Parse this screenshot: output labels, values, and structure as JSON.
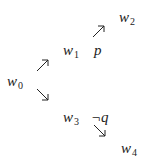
{
  "nodes": {
    "w0": {
      "base": "w",
      "sub": "0"
    },
    "w1": {
      "base": "w",
      "sub": "1"
    },
    "w2": {
      "base": "w",
      "sub": "2"
    },
    "w3": {
      "base": "w",
      "sub": "3"
    },
    "w4": {
      "base": "w",
      "sub": "4"
    }
  },
  "props": {
    "p": "p",
    "not_q": "¬q"
  },
  "edges": [
    {
      "from": "w0",
      "to": "w1",
      "direction": "up-right"
    },
    {
      "from": "w0",
      "to": "w3",
      "direction": "down-right"
    },
    {
      "from": "w1",
      "to": "w2",
      "direction": "up-right"
    },
    {
      "from": "w3",
      "to": "w4",
      "direction": "down-right"
    }
  ]
}
